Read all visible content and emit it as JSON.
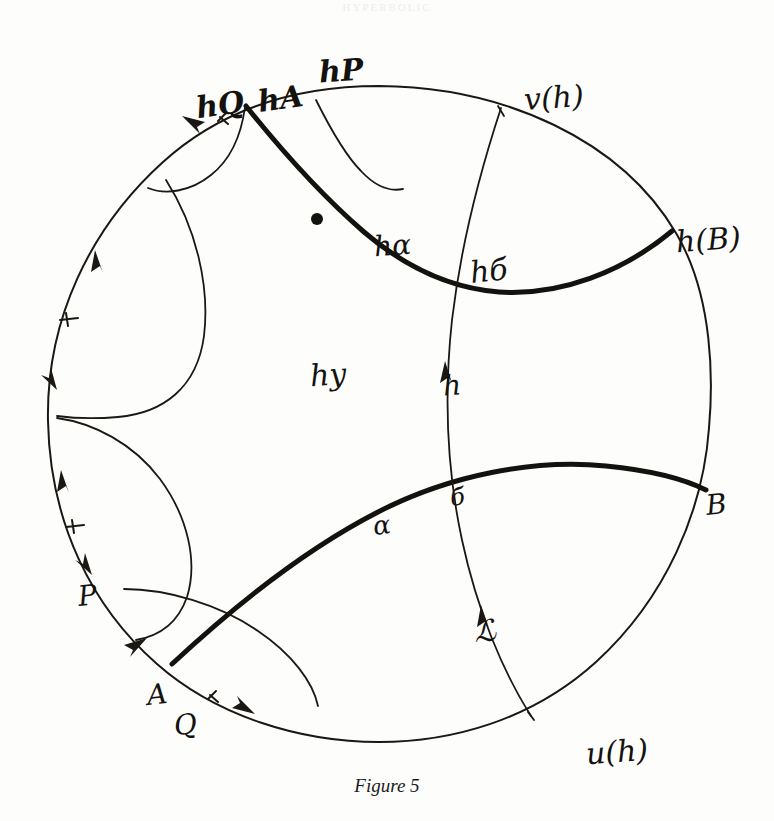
{
  "page": {
    "running_head": "HYPERBOLIC",
    "background_color": "#fdfdfc",
    "ink_color": "#14120f"
  },
  "caption": {
    "text": "Figure 5"
  },
  "figure": {
    "boundary_circle": {
      "cx": 379,
      "cy": 415,
      "r": 330,
      "stroke_width": 2.0
    }
  },
  "labels": [
    {
      "id": "hQ",
      "text": "hQ",
      "x": 196,
      "y": 90,
      "size": 30,
      "rotate": -8,
      "bold": true
    },
    {
      "id": "hA",
      "text": "hA",
      "x": 258,
      "y": 84,
      "size": 30,
      "rotate": -8,
      "bold": true
    },
    {
      "id": "hP",
      "text": "hP",
      "x": 319,
      "y": 56,
      "size": 30,
      "rotate": -4,
      "bold": true
    },
    {
      "id": "v_h",
      "text": "v(h)",
      "x": 524,
      "y": 83,
      "size": 30,
      "rotate": -4,
      "bold": false
    },
    {
      "id": "h_B",
      "text": "h(B)",
      "x": 676,
      "y": 225,
      "size": 30,
      "rotate": -4,
      "bold": false
    },
    {
      "id": "h_alpha",
      "text": "hα",
      "x": 374,
      "y": 232,
      "size": 28,
      "rotate": -4,
      "bold": false
    },
    {
      "id": "h_b",
      "text": "hб",
      "x": 470,
      "y": 256,
      "size": 30,
      "rotate": -6,
      "bold": false
    },
    {
      "id": "h_y",
      "text": "hy",
      "x": 310,
      "y": 360,
      "size": 30,
      "rotate": -4,
      "bold": false
    },
    {
      "id": "h",
      "text": "h",
      "x": 443,
      "y": 372,
      "size": 28,
      "rotate": -4,
      "bold": false
    },
    {
      "id": "B",
      "text": "B",
      "x": 706,
      "y": 491,
      "size": 28,
      "rotate": -6,
      "bold": false
    },
    {
      "id": "alpha",
      "text": "α",
      "x": 373,
      "y": 512,
      "size": 26,
      "rotate": -8,
      "bold": false
    },
    {
      "id": "b",
      "text": "б",
      "x": 450,
      "y": 485,
      "size": 24,
      "rotate": -6,
      "bold": false
    },
    {
      "id": "L",
      "text": "ℒ",
      "x": 474,
      "y": 616,
      "size": 30,
      "rotate": -4,
      "bold": false
    },
    {
      "id": "P",
      "text": "P",
      "x": 78,
      "y": 582,
      "size": 28,
      "rotate": -6,
      "bold": false
    },
    {
      "id": "A",
      "text": "A",
      "x": 147,
      "y": 681,
      "size": 28,
      "rotate": -6,
      "bold": false
    },
    {
      "id": "Q",
      "text": "Q",
      "x": 174,
      "y": 711,
      "size": 28,
      "rotate": -6,
      "bold": false
    },
    {
      "id": "u_h",
      "text": "u(h)",
      "x": 586,
      "y": 737,
      "size": 30,
      "rotate": -4,
      "bold": false
    }
  ],
  "geodesics": [
    {
      "id": "h-alpha-arc",
      "kind": "thick",
      "label_ref": "h_alpha"
    },
    {
      "id": "h-B-arc",
      "kind": "thick",
      "label_ref": "h_B"
    },
    {
      "id": "alpha-arc",
      "kind": "thick",
      "label_ref": "alpha"
    },
    {
      "id": "B-arc",
      "kind": "thick",
      "label_ref": "B"
    },
    {
      "id": "v-u-arc",
      "kind": "thin",
      "label_ref": "h"
    },
    {
      "id": "hP-arc",
      "kind": "thin",
      "label_ref": "hP"
    },
    {
      "id": "hQ-arc",
      "kind": "thin",
      "label_ref": "hQ"
    },
    {
      "id": "left-upper-arc",
      "kind": "thin",
      "label_ref": "P"
    },
    {
      "id": "left-lower-arc",
      "kind": "thin",
      "label_ref": "A"
    },
    {
      "id": "bottom-left-arc",
      "kind": "thin",
      "label_ref": "Q"
    }
  ],
  "boundary_arrows": {
    "count": 6,
    "description": "orientation arrowheads and tick marks along boundary circle"
  }
}
